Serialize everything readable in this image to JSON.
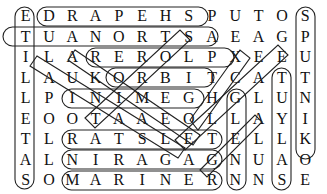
{
  "puzzle": {
    "type": "word-search",
    "rows": 9,
    "cols": 13,
    "grid": [
      [
        "E",
        "D",
        "R",
        "A",
        "P",
        "E",
        "H",
        "S",
        "P",
        "U",
        "T",
        "O",
        "S"
      ],
      [
        "T",
        "U",
        "A",
        "N",
        "O",
        "R",
        "T",
        "S",
        "A",
        "E",
        "A",
        "G",
        "P"
      ],
      [
        "I",
        "L",
        "A",
        "R",
        "E",
        "R",
        "O",
        "L",
        "P",
        "X",
        "E",
        "E",
        "U"
      ],
      [
        "L",
        "A",
        "U",
        "K",
        "O",
        "R",
        "B",
        "I",
        "T",
        "C",
        "A",
        "T",
        "T"
      ],
      [
        "L",
        "P",
        "I",
        "N",
        "I",
        "M",
        "E",
        "G",
        "H",
        "G",
        "L",
        "U",
        "N"
      ],
      [
        "E",
        "O",
        "O",
        "T",
        "A",
        "A",
        "E",
        "O",
        "L",
        "L",
        "A",
        "Y",
        "I"
      ],
      [
        "T",
        "L",
        "R",
        "A",
        "T",
        "S",
        "L",
        "E",
        "T",
        "E",
        "L",
        "L",
        "K"
      ],
      [
        "A",
        "L",
        "N",
        "I",
        "R",
        "A",
        "G",
        "A",
        "G",
        "N",
        "U",
        "A",
        "O"
      ],
      [
        "S",
        "O",
        "M",
        "A",
        "R",
        "I",
        "N",
        "E",
        "R",
        "N",
        "N",
        "S",
        "E"
      ]
    ],
    "found_words": [
      {
        "word": "SHEPARD",
        "start": [
          0,
          7
        ],
        "end": [
          0,
          1
        ],
        "direction": "horizontal-reverse"
      },
      {
        "word": "ASTRONAUT",
        "start": [
          1,
          9
        ],
        "end": [
          1,
          0
        ],
        "direction": "horizontal-reverse"
      },
      {
        "word": "EXPLORER",
        "start": [
          2,
          10
        ],
        "end": [
          2,
          3
        ],
        "direction": "horizontal-reverse"
      },
      {
        "word": "ORBIT",
        "start": [
          3,
          4
        ],
        "end": [
          3,
          8
        ],
        "direction": "horizontal"
      },
      {
        "word": "GEMINI",
        "start": [
          4,
          7
        ],
        "end": [
          4,
          2
        ],
        "direction": "horizontal-reverse"
      },
      {
        "word": "SATELLITE",
        "start": [
          6,
          0
        ],
        "end": [
          6,
          8
        ],
        "direction": "mixed"
      },
      {
        "word": "GAGARIN",
        "start": [
          7,
          8
        ],
        "end": [
          7,
          2
        ],
        "direction": "horizontal-reverse"
      },
      {
        "word": "MARINER",
        "start": [
          8,
          2
        ],
        "end": [
          8,
          8
        ],
        "direction": "horizontal"
      },
      {
        "word": "SPUTNIK",
        "start": [
          0,
          12
        ],
        "end": [
          6,
          12
        ],
        "direction": "vertical"
      },
      {
        "word": "SATELLITE",
        "start": [
          8,
          0
        ],
        "end": [
          0,
          0
        ],
        "direction": "vertical-reverse"
      },
      {
        "word": "GLENN",
        "start": [
          4,
          9
        ],
        "end": [
          8,
          9
        ],
        "direction": "vertical"
      },
      {
        "word": "TULSA",
        "start": [
          3,
          11
        ],
        "end": [
          8,
          11
        ],
        "direction": "vertical"
      },
      {
        "word": "LAUNCH",
        "start": [
          2,
          1
        ],
        "end": [
          7,
          6
        ],
        "direction": "diagonal"
      },
      {
        "word": "TELESCOPE",
        "start": [
          5,
          3
        ],
        "end": [
          1,
          7
        ],
        "direction": "diagonal"
      },
      {
        "word": "GALILEO",
        "start": [
          7,
          7
        ],
        "end": [
          2,
          11
        ],
        "direction": "diagonal"
      },
      {
        "word": "ALTA",
        "start": [
          2,
          2
        ],
        "end": [
          6,
          7
        ],
        "direction": "diagonal"
      }
    ]
  }
}
